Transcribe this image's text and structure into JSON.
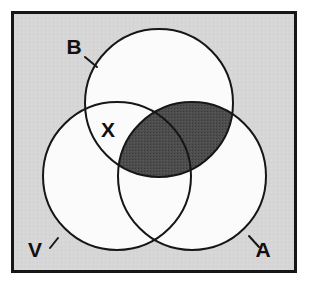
{
  "figure": {
    "kind": "venn-diagram",
    "canvas": {
      "width": 314,
      "height": 284
    },
    "outer_background_color": "#ffffff"
  },
  "frame": {
    "name": "diagram-border",
    "x": 11,
    "y": 11,
    "width": 286,
    "height": 262,
    "fill_color": "#d6d6d6",
    "stroke_color": "#161616",
    "stroke_width": 3
  },
  "circles": [
    {
      "id": "B",
      "label": "B",
      "position": "top",
      "cx": 159,
      "cy": 103,
      "r": 74,
      "fill_color": "#fbfbfb",
      "stroke_color": "#161616",
      "stroke_width": 2
    },
    {
      "id": "V",
      "label": "V",
      "position": "bottom-left",
      "cx": 117,
      "cy": 176,
      "r": 74,
      "fill_color": "#fbfbfb",
      "stroke_color": "#161616",
      "stroke_width": 2
    },
    {
      "id": "A",
      "label": "A",
      "position": "bottom-right",
      "cx": 192,
      "cy": 176,
      "r": 74,
      "fill_color": "#fbfbfb",
      "stroke_color": "#161616",
      "stroke_width": 2
    }
  ],
  "shaded_regions": [
    {
      "id": "B-and-A",
      "description": "Intersection of circle B and circle A, shaded dark gray",
      "sets": [
        "B",
        "A"
      ],
      "fill_color": "#4d4d4d",
      "stroke_color": "#161616"
    }
  ],
  "labels": [
    {
      "id": "label-B",
      "text": "B",
      "x": 74,
      "y": 54,
      "font_size": 21,
      "leader": {
        "x1": 85,
        "y1": 57,
        "x2": 97,
        "y2": 67
      }
    },
    {
      "id": "label-V",
      "text": "V",
      "x": 35,
      "y": 257,
      "font_size": 21,
      "leader": {
        "x1": 50,
        "y1": 248,
        "x2": 58,
        "y2": 238
      }
    },
    {
      "id": "label-A",
      "text": "A",
      "x": 263,
      "y": 257,
      "font_size": 21,
      "leader": {
        "x1": 259,
        "y1": 247,
        "x2": 249,
        "y2": 236
      }
    },
    {
      "id": "label-X",
      "text": "X",
      "x": 108,
      "y": 137,
      "font_size": 21,
      "region": "B-and-V-only",
      "leader": null
    }
  ]
}
